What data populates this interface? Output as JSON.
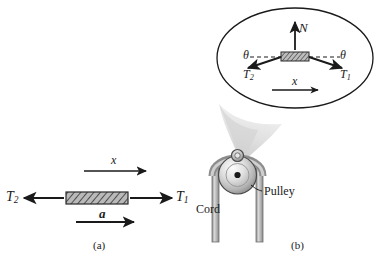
{
  "figure": {
    "type": "physics-free-body-diagram",
    "background_color": "#ffffff",
    "ink_color": "#1a1a1a",
    "shade_color": "#c8c8c8"
  },
  "panel_a": {
    "label": "(a)",
    "axis_label": "x",
    "tension_left": {
      "symbol": "T",
      "subscript": "2"
    },
    "tension_right": {
      "symbol": "T",
      "subscript": "1"
    },
    "acceleration_label": "a",
    "block_style": "hatched-rectangle"
  },
  "panel_b": {
    "label": "(b)",
    "cord_label": "Cord",
    "pulley_label": "Pulley",
    "inset": {
      "normal_force_label": "N",
      "angle_left_label": "θ",
      "angle_right_label": "θ",
      "tension_left": {
        "symbol": "T",
        "subscript": "2"
      },
      "tension_right": {
        "symbol": "T",
        "subscript": "1"
      },
      "axis_label": "x",
      "shape": "ellipse"
    }
  }
}
